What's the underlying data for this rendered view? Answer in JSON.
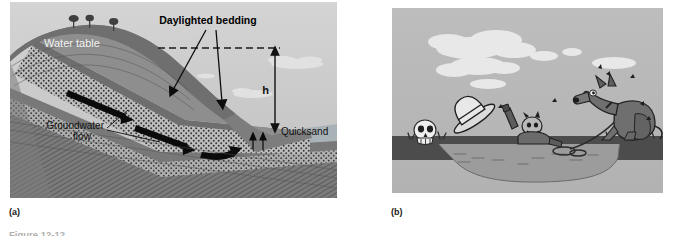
{
  "figure": {
    "caption": "Figure 12-12",
    "panels": [
      {
        "key": "a",
        "sublabel": "(a)",
        "type": "geology-cross-section-diagram",
        "labels": {
          "water_table": "Water table",
          "daylighted_bedding": "Daylighted bedding",
          "groundwater_flow_line1": "Groundwater",
          "groundwater_flow_line2": "flow",
          "quicksand": "Quicksand",
          "height_symbol": "h"
        },
        "colors": {
          "sky": "#c9c9c9",
          "hill_front": "#8d8d8d",
          "hill_back": "#6b6b6b",
          "sand_layer": "#b9b9b9",
          "shale_layer": "#6f6f6f",
          "water": "#a6b0b4",
          "arrow": "#111111",
          "dash_line": "#1a1a1a"
        },
        "elements": [
          "trees-on-hilltop",
          "dashed-water-table-line",
          "stippled-sand-beds",
          "groundwater-flow-arrows",
          "height-dimension-arrow",
          "quicksand-seep-arrows",
          "clouds"
        ]
      },
      {
        "key": "b",
        "sublabel": "(b)",
        "type": "cartoon-illustration",
        "colors": {
          "sky": "#b8b8b8",
          "cloud": "#e6e6e6",
          "ground": "#4a4a4a",
          "quicksand_pool": "#9a9a9a",
          "dog": "#6d6d6d",
          "skull": "#efefef",
          "rope": "#3a3a3a"
        },
        "elements": [
          "clouds",
          "skull-on-bank",
          "flying-hat",
          "sinking-cowboy",
          "quicksand-pool",
          "rope",
          "dog-sitting-on-bank",
          "grass-tufts",
          "motion-flies"
        ]
      }
    ]
  }
}
